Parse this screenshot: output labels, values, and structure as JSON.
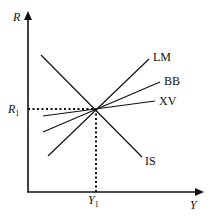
{
  "diagram": {
    "axes": {
      "y_label": "R",
      "x_label": "Y",
      "y_tick_label": "R",
      "y_tick_sub": "1",
      "x_tick_label": "Y",
      "x_tick_sub": "1"
    },
    "curves": [
      {
        "name": "LM",
        "label": "LM",
        "from": [
          48,
          156
        ],
        "to": [
          149,
          59
        ]
      },
      {
        "name": "BB",
        "label": "BB",
        "from": [
          43,
          132
        ],
        "to": [
          160,
          82
        ]
      },
      {
        "name": "XV",
        "label": "XV",
        "from": [
          43,
          116
        ],
        "to": [
          155,
          101
        ]
      },
      {
        "name": "IS",
        "label": "IS",
        "from": [
          41,
          55
        ],
        "to": [
          142,
          157
        ]
      }
    ],
    "equilibrium": {
      "x": 96,
      "y": 109
    },
    "colors": {
      "line": "#111111",
      "background": "#ffffff"
    }
  }
}
